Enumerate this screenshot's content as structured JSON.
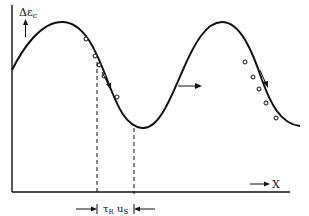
{
  "diagram": {
    "y_axis_label_prefix": "Δε",
    "y_axis_label_sub": "c",
    "x_axis_label": "X",
    "interval_label_tau": "τ",
    "interval_label_tau_sub": "R",
    "interval_label_u": " u",
    "interval_label_u_sub": "S",
    "curve": "traveling sinusoidal wave of strain increment Δε_c vs position X",
    "annotations": {
      "propagation_arrow": "horizontal arrow at left-rising flank of second crest pointing right (wave moves in +X)",
      "particle_arrows": "two downward-diagonal arrows along descending flanks indicating particle motion",
      "marker_points_first_flank": 5,
      "marker_points_second_flank": 5,
      "dashed_lines": 2
    },
    "colors": {
      "ink": "#111111",
      "background": "#ffffff"
    }
  }
}
